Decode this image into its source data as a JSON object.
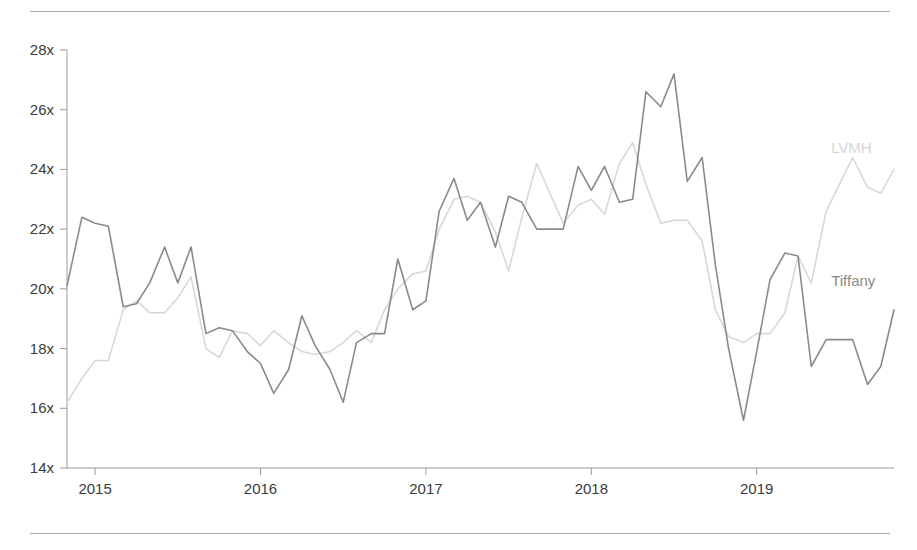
{
  "figure": {
    "top_rule": "divider",
    "bottom_rule": "divider"
  },
  "chart_data": {
    "type": "line",
    "title": "",
    "subtitle": "",
    "xlabel": "",
    "ylabel": "",
    "grid": false,
    "legend_position": "inline-right",
    "xticks": [
      "2015",
      "2016",
      "2017",
      "2018",
      "2019"
    ],
    "xtick_values": [
      2015,
      2016,
      2017,
      2018,
      2019
    ],
    "yticks": [
      "14x",
      "16x",
      "18x",
      "20x",
      "22x",
      "24x",
      "26x",
      "28x"
    ],
    "ytick_values": [
      14,
      16,
      18,
      20,
      22,
      24,
      26,
      28
    ],
    "ylim": [
      14,
      28
    ],
    "xlim": [
      2014.83,
      2019.83
    ],
    "y_unit": "x",
    "series": [
      {
        "name": "LVMH",
        "color": "#d8d8d8",
        "label_color": "#d5d5d5",
        "label_x": 2019.45,
        "label_y": 24.55,
        "x": [
          2014.83,
          2014.92,
          2015.0,
          2015.08,
          2015.17,
          2015.25,
          2015.33,
          2015.42,
          2015.5,
          2015.58,
          2015.67,
          2015.75,
          2015.83,
          2015.92,
          2016.0,
          2016.08,
          2016.17,
          2016.25,
          2016.33,
          2016.42,
          2016.5,
          2016.58,
          2016.67,
          2016.75,
          2016.83,
          2016.92,
          2017.0,
          2017.08,
          2017.17,
          2017.25,
          2017.33,
          2017.42,
          2017.5,
          2017.58,
          2017.67,
          2017.75,
          2017.83,
          2017.92,
          2018.0,
          2018.08,
          2018.17,
          2018.25,
          2018.33,
          2018.42,
          2018.5,
          2018.58,
          2018.67,
          2018.75,
          2018.83,
          2018.92,
          2019.0,
          2019.08,
          2019.17,
          2019.25,
          2019.33,
          2019.42,
          2019.5,
          2019.58,
          2019.67,
          2019.75,
          2019.83
        ],
        "values": [
          16.2,
          17.0,
          17.6,
          17.6,
          19.3,
          19.6,
          19.2,
          19.2,
          19.7,
          20.4,
          18.0,
          17.7,
          18.6,
          18.5,
          18.1,
          18.6,
          18.2,
          17.9,
          17.8,
          17.9,
          18.2,
          18.6,
          18.2,
          19.3,
          20.0,
          20.5,
          20.6,
          22.0,
          23.0,
          23.1,
          22.9,
          21.9,
          20.6,
          22.4,
          24.2,
          23.2,
          22.2,
          22.8,
          23.0,
          22.5,
          24.2,
          24.9,
          23.5,
          22.2,
          22.3,
          22.3,
          21.6,
          19.3,
          18.4,
          18.2,
          18.5,
          18.5,
          19.2,
          21.1,
          20.2,
          22.6,
          23.5,
          24.4,
          23.4,
          23.2,
          24.0
        ]
      },
      {
        "name": "Tiffany",
        "color": "#8a8a8a",
        "label_color": "#8a8a8a",
        "label_x": 2019.45,
        "label_y": 20.1,
        "x": [
          2014.83,
          2014.92,
          2015.0,
          2015.08,
          2015.17,
          2015.25,
          2015.33,
          2015.42,
          2015.5,
          2015.58,
          2015.67,
          2015.75,
          2015.83,
          2015.92,
          2016.0,
          2016.08,
          2016.17,
          2016.25,
          2016.33,
          2016.42,
          2016.5,
          2016.58,
          2016.67,
          2016.75,
          2016.83,
          2016.92,
          2017.0,
          2017.08,
          2017.17,
          2017.25,
          2017.33,
          2017.42,
          2017.5,
          2017.58,
          2017.67,
          2017.75,
          2017.83,
          2017.92,
          2018.0,
          2018.08,
          2018.17,
          2018.25,
          2018.33,
          2018.42,
          2018.5,
          2018.58,
          2018.67,
          2018.75,
          2018.83,
          2018.92,
          2019.0,
          2019.08,
          2019.17,
          2019.25,
          2019.33,
          2019.42,
          2019.5,
          2019.58,
          2019.67,
          2019.75,
          2019.83
        ],
        "values": [
          20.1,
          22.4,
          22.2,
          22.1,
          19.4,
          19.5,
          20.2,
          21.4,
          20.2,
          21.4,
          18.5,
          18.7,
          18.6,
          17.9,
          17.5,
          16.5,
          17.3,
          19.1,
          18.1,
          17.3,
          16.2,
          18.2,
          18.5,
          18.5,
          21.0,
          19.3,
          19.6,
          22.6,
          23.7,
          22.3,
          22.9,
          21.4,
          23.1,
          22.9,
          22.0,
          22.0,
          22.0,
          24.1,
          23.3,
          24.1,
          22.9,
          23.0,
          26.6,
          26.1,
          27.2,
          23.6,
          24.4,
          20.8,
          18.0,
          15.6,
          17.9,
          20.3,
          21.2,
          21.1,
          17.4,
          18.3,
          18.3,
          18.3,
          16.8,
          17.4,
          19.3
        ]
      }
    ]
  }
}
